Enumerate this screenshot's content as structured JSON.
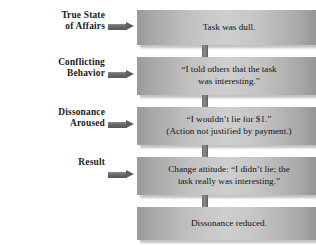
{
  "diagram": {
    "accent_color": "#5d5d5d",
    "box_fill_light": "#cfcfcf",
    "box_fill_dark": "#8f8f8f",
    "text_color": "#141414",
    "rows": [
      {
        "label": "True State\nof Affairs",
        "has_label": true,
        "has_arrow": true,
        "box_text": "Task was dull."
      },
      {
        "label": "Conflicting\nBehavior",
        "has_label": true,
        "has_arrow": true,
        "box_text": "“I told others that the task\nwas interesting.”"
      },
      {
        "label": "Dissonance\nAroused",
        "has_label": true,
        "has_arrow": true,
        "box_text": "“I wouldn’t lie for $1.”\n(Action not justified by payment.)"
      },
      {
        "label": "Result",
        "has_label": true,
        "has_arrow": true,
        "box_text": "Change attitude: “I didn’t lie; the\ntask really was interesting.”"
      },
      {
        "label": "",
        "has_label": false,
        "has_arrow": false,
        "box_text": "Dissonance reduced."
      }
    ]
  }
}
